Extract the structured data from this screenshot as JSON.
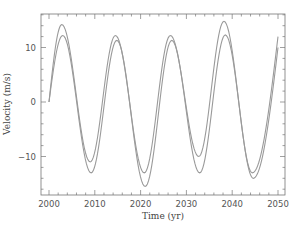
{
  "chart_data": {
    "type": "line",
    "title": "",
    "xlabel": "Time (yr)",
    "ylabel": "Velocity (m/s)",
    "xlim": [
      1998,
      2051
    ],
    "ylim": [
      -17.5,
      16.5
    ],
    "xticks": [
      2000,
      2010,
      2020,
      2030,
      2040,
      2050
    ],
    "yticks": [
      -10,
      0,
      10
    ],
    "grid": false,
    "legend": null,
    "series": [
      {
        "name": "curve-1",
        "x": [
          2000,
          2002.8,
          2009.0,
          2014.5,
          2020.8,
          2026.5,
          2032.7,
          2038.2,
          2044.4,
          2050
        ],
        "values": [
          0,
          14.2,
          -11.0,
          12.2,
          -13.0,
          12.2,
          -10.0,
          14.8,
          -13.0,
          12.0
        ]
      },
      {
        "name": "curve-2",
        "x": [
          2000,
          2003.0,
          2009.2,
          2014.8,
          2021.0,
          2026.8,
          2032.9,
          2038.5,
          2044.6,
          2050
        ],
        "values": [
          0,
          12.2,
          -13.0,
          11.3,
          -15.5,
          11.3,
          -13.0,
          12.3,
          -14.0,
          10.0
        ]
      }
    ],
    "style": {
      "line_color": "#9a9a9a",
      "axis_color": "#777777"
    }
  }
}
